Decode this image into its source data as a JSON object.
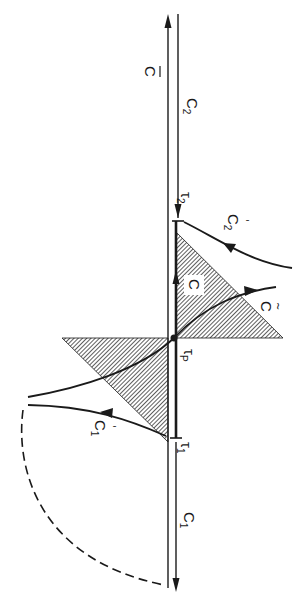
{
  "figure": {
    "orientation": "rotated 90 degrees clockwise",
    "labels": {
      "c_bar": "C",
      "c2": "C",
      "c2_sub": "2",
      "c1": "C",
      "c1_sub": "1",
      "tau2": "τ",
      "tau2_sub": "2",
      "tau1": "τ",
      "tau1_sub": "1",
      "tauP": "τ",
      "tauP_sub": "P",
      "c_inner": "C",
      "c_tilde": "C",
      "c2_prime": "C",
      "c2_prime_sub": "2",
      "c1_prime": "C",
      "c1_prime_sub": "1"
    },
    "colors": {
      "ink": "#1a1a1a",
      "hatch_bg": "#ffffff"
    }
  }
}
